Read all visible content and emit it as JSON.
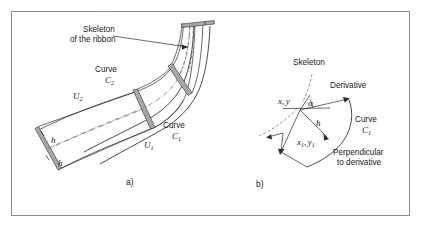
{
  "figure": {
    "caption_panels": [
      "a)",
      "b)"
    ],
    "background_color": "#ffffff",
    "frame_color": "#8c8c8c",
    "ink_color": "#2b2b2b",
    "accent_bar_color": "#a8a8a8",
    "guide_color": "#6e6e6e"
  },
  "panel_a": {
    "tag": "a)",
    "callout": {
      "line1": "Skeleton",
      "line2": "of the ribbon",
      "pointer_icon": "arrow-right-icon"
    },
    "curve_c2_label": {
      "word": "Curve",
      "symbol": "C",
      "subscript": "2"
    },
    "curve_c1_label": {
      "word": "Curve",
      "symbol": "C",
      "subscript": "1"
    },
    "node_u2": {
      "symbol": "U",
      "subscript": "2"
    },
    "node_u1": {
      "symbol": "U",
      "subscript": "1"
    },
    "thickness_labels": [
      "h",
      "h"
    ]
  },
  "panel_b": {
    "tag": "b)",
    "skeleton_label": "Skeleton",
    "derivative_label": "Derivative",
    "perpendicular_label_line1": "Perpendicular",
    "perpendicular_label_line2": "to derivative",
    "curve_c1_label": {
      "word": "Curve",
      "symbol": "C",
      "subscript": "1"
    },
    "point_xy": {
      "x": "x,",
      "y": "y"
    },
    "point_x1y1": {
      "x": "x",
      "x_sub": "1",
      "comma": ",",
      "y": "y",
      "y_sub": "1"
    },
    "angle_label": "α",
    "height_label": "h"
  }
}
